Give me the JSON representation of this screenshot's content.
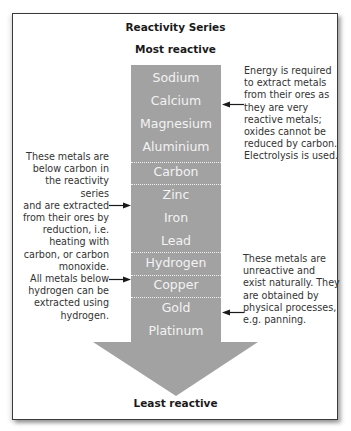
{
  "diagram": {
    "title": "Reactivity Series",
    "top_label": "Most reactive",
    "bottom_label": "Least reactive",
    "colors": {
      "column": "#a2a2a2",
      "metal_text": "#f3f3f3",
      "note_text": "#333333",
      "frame_border": "#3a3a3a"
    },
    "metals": [
      {
        "name": "Sodium"
      },
      {
        "name": "Calcium"
      },
      {
        "name": "Magnesium"
      },
      {
        "name": "Aluminium"
      },
      {
        "name": "Carbon"
      },
      {
        "name": "Zinc"
      },
      {
        "name": "Iron"
      },
      {
        "name": "Lead"
      },
      {
        "name": "Hydrogen"
      },
      {
        "name": "Copper"
      },
      {
        "name": "Gold"
      },
      {
        "name": "Platinum"
      }
    ],
    "notes": {
      "electrolysis": {
        "lines": [
          "Energy is required",
          "to extract metals",
          "from their ores as",
          "they are very",
          "reactive metals;",
          "oxides cannot be",
          "reduced by carbon.",
          "Electrolysis is used."
        ],
        "points_to": "Calcium"
      },
      "carbon_reduction": {
        "lines": [
          "These metals are",
          "below carbon in",
          "the reactivity series",
          "and are extracted",
          "from their ores by",
          "reduction, i.e.",
          "heating with",
          "carbon, or carbon",
          "monoxide."
        ],
        "points_to": "Zinc"
      },
      "hydrogen": {
        "lines": [
          "All metals below",
          "hydrogen can be",
          "extracted using",
          "hydrogen."
        ],
        "points_to": "Copper"
      },
      "native": {
        "lines": [
          "These metals are",
          "unreactive and",
          "exist naturally. They",
          "are obtained by",
          "physical processes,",
          "e.g. panning."
        ],
        "points_to": "Gold"
      }
    }
  }
}
